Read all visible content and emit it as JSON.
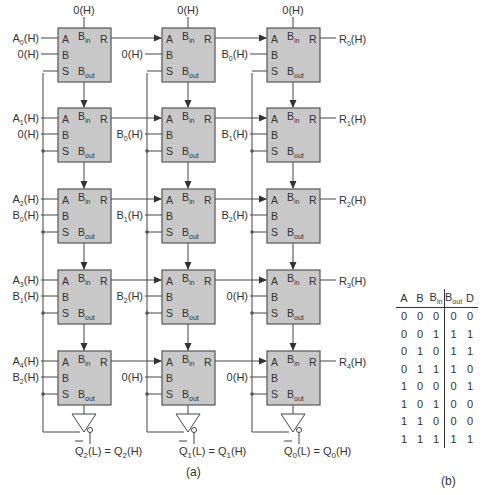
{
  "figure": {
    "caption_a": "(a)",
    "caption_b": "(b)"
  },
  "colors": {
    "block_fill": "#c8c8c8",
    "block_stroke": "#555555",
    "wire": "#444444"
  },
  "block_pins": {
    "a": "A",
    "b": "B",
    "s": "S",
    "bin": "B",
    "bin_sub": "in",
    "bout": "B",
    "bout_sub": "out",
    "r": "R"
  },
  "columns": [
    {
      "top_input": "0(H)",
      "a_inputs": [
        {
          "main": "A",
          "sub": "0",
          "suffix": "(H)"
        },
        {
          "main": "A",
          "sub": "1",
          "suffix": "(H)"
        },
        {
          "main": "A",
          "sub": "2",
          "suffix": "(H)"
        },
        {
          "main": "A",
          "sub": "3",
          "suffix": "(H)"
        },
        {
          "main": "A",
          "sub": "4",
          "suffix": "(H)"
        }
      ],
      "b_inputs": [
        {
          "main": "0",
          "sub": "",
          "suffix": "(H)"
        },
        {
          "main": "0",
          "sub": "",
          "suffix": "(H)"
        },
        {
          "main": "B",
          "sub": "0",
          "suffix": "(H)"
        },
        {
          "main": "B",
          "sub": "1",
          "suffix": "(H)"
        },
        {
          "main": "B",
          "sub": "2",
          "suffix": "(H)"
        }
      ],
      "output": {
        "bar": "Q",
        "sub": "2",
        "mid": "(L) = Q",
        "sub2": "2",
        "end": "(H)"
      }
    },
    {
      "top_input": "0(H)",
      "b_inputs": [
        {
          "main": "0",
          "sub": "",
          "suffix": "(H)"
        },
        {
          "main": "B",
          "sub": "0",
          "suffix": "(H)"
        },
        {
          "main": "B",
          "sub": "1",
          "suffix": "(H)"
        },
        {
          "main": "B",
          "sub": "2",
          "suffix": "(H)"
        },
        {
          "main": "0",
          "sub": "",
          "suffix": "(H)"
        }
      ],
      "output": {
        "bar": "Q",
        "sub": "1",
        "mid": "(L) = Q",
        "sub2": "1",
        "end": "(H)"
      }
    },
    {
      "top_input": "0(H)",
      "b_inputs": [
        {
          "main": "B",
          "sub": "0",
          "suffix": "(H)"
        },
        {
          "main": "B",
          "sub": "1",
          "suffix": "(H)"
        },
        {
          "main": "B",
          "sub": "2",
          "suffix": "(H)"
        },
        {
          "main": "0",
          "sub": "",
          "suffix": "(H)"
        },
        {
          "main": "0",
          "sub": "",
          "suffix": "(H)"
        }
      ],
      "r_outputs": [
        {
          "main": "R",
          "sub": "0",
          "suffix": "(H)"
        },
        {
          "main": "R",
          "sub": "1",
          "suffix": "(H)"
        },
        {
          "main": "R",
          "sub": "2",
          "suffix": "(H)"
        },
        {
          "main": "R",
          "sub": "3",
          "suffix": "(H)"
        },
        {
          "main": "R",
          "sub": "4",
          "suffix": "(H)"
        }
      ],
      "output": {
        "bar": "Q",
        "sub": "0",
        "mid": "(L) = Q",
        "sub2": "0",
        "end": "(H)"
      }
    }
  ],
  "truth_table": {
    "headers": [
      {
        "main": "A",
        "sub": ""
      },
      {
        "main": "B",
        "sub": ""
      },
      {
        "main": "B",
        "sub": "in"
      },
      {
        "main": "B",
        "sub": "out"
      },
      {
        "main": "D",
        "sub": ""
      }
    ],
    "rows": [
      [
        "0",
        "0",
        "0",
        "0",
        "0"
      ],
      [
        "0",
        "0",
        "1",
        "1",
        "1"
      ],
      [
        "0",
        "1",
        "0",
        "1",
        "1"
      ],
      [
        "0",
        "1",
        "1",
        "1",
        "0"
      ],
      [
        "1",
        "0",
        "0",
        "0",
        "1"
      ],
      [
        "1",
        "0",
        "1",
        "0",
        "0"
      ],
      [
        "1",
        "1",
        "0",
        "0",
        "0"
      ],
      [
        "1",
        "1",
        "1",
        "1",
        "1"
      ]
    ]
  }
}
